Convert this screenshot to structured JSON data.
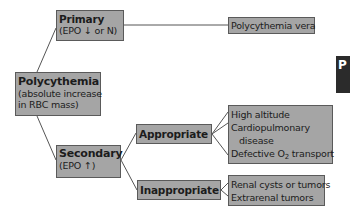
{
  "diagram": {
    "root": {
      "title": "Polycythemia",
      "subtitle_line1": "(absolute increase",
      "subtitle_line2": "in RBC mass)"
    },
    "primary": {
      "title": "Primary",
      "subtitle": "(EPO ↓ or N)",
      "result": "Polycythemia vera"
    },
    "secondary": {
      "title": "Secondary",
      "subtitle": "(EPO ↑)",
      "appropriate": {
        "title": "Appropriate",
        "causes": [
          "High altitude",
          "Cardiopulmonary",
          "disease",
          "Defective O",
          "2",
          " transport"
        ]
      },
      "inappropriate": {
        "title": "Inappropriate",
        "causes": [
          "Renal cysts or tumors",
          "Extrarenal tumors"
        ]
      }
    }
  },
  "side_tab": {
    "label": "P"
  }
}
